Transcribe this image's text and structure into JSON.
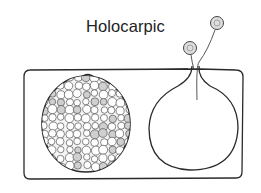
{
  "diagram": {
    "title": "Holocarpic",
    "elements": [
      {
        "name": "host-cell",
        "shape": "rounded-rectangle"
      },
      {
        "name": "sporangium-full",
        "content": "zoospores"
      },
      {
        "name": "sporangium-empty",
        "feature": "discharge-tube"
      },
      {
        "name": "released-zoospore-1"
      },
      {
        "name": "released-zoospore-2"
      }
    ],
    "colors": {
      "stroke": "#2a2a2a",
      "spore_fill": "#d8d8d8",
      "background": "#ffffff"
    }
  }
}
